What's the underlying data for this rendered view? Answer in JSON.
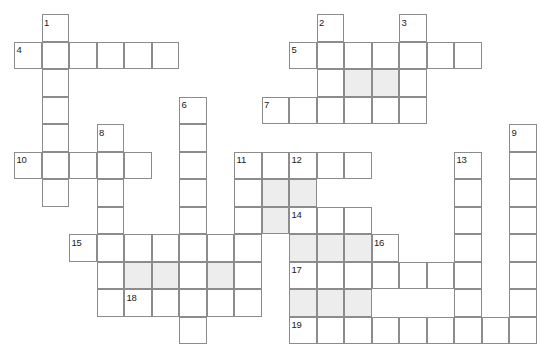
{
  "puzzle": {
    "kind": "crossword-grid",
    "width": 555,
    "height": 359,
    "origin_x": 14,
    "origin_y": 14,
    "cell": 27.5,
    "colors": {
      "background": "#ffffff",
      "cell_fill": "#ffffff",
      "shaded_fill": "#ededed",
      "border": "#8c8c8c",
      "number": "#1a1a1a"
    },
    "numbers": [
      {
        "label": "1",
        "col": 1,
        "row": 0
      },
      {
        "label": "2",
        "col": 11,
        "row": 0
      },
      {
        "label": "3",
        "col": 14,
        "row": 0
      },
      {
        "label": "4",
        "col": 0,
        "row": 1
      },
      {
        "label": "5",
        "col": 10,
        "row": 1
      },
      {
        "label": "6",
        "col": 6,
        "row": 3
      },
      {
        "label": "7",
        "col": 9,
        "row": 3
      },
      {
        "label": "8",
        "col": 3,
        "row": 4
      },
      {
        "label": "9",
        "col": 18,
        "row": 4
      },
      {
        "label": "10",
        "col": 0,
        "row": 5
      },
      {
        "label": "11",
        "col": 8,
        "row": 5
      },
      {
        "label": "12",
        "col": 10,
        "row": 5
      },
      {
        "label": "13",
        "col": 16,
        "row": 5
      },
      {
        "label": "14",
        "col": 10,
        "row": 7
      },
      {
        "label": "15",
        "col": 2,
        "row": 8
      },
      {
        "label": "16",
        "col": 13,
        "row": 8
      },
      {
        "label": "17",
        "col": 10,
        "row": 9
      },
      {
        "label": "18",
        "col": 4,
        "row": 10
      },
      {
        "label": "19",
        "col": 10,
        "row": 11
      }
    ],
    "entries": [
      {
        "name": "entry-1-down",
        "number": "1",
        "col": 1,
        "row": 0,
        "length": 6,
        "dir": "down"
      },
      {
        "name": "entry-2-down",
        "number": "2",
        "col": 11,
        "row": 0,
        "length": 4,
        "dir": "down"
      },
      {
        "name": "entry-3-down",
        "number": "3",
        "col": 14,
        "row": 0,
        "length": 4,
        "dir": "down"
      },
      {
        "name": "entry-4-across",
        "number": "4",
        "col": 0,
        "row": 1,
        "length": 6,
        "dir": "across"
      },
      {
        "name": "entry-5-across",
        "number": "5",
        "col": 10,
        "row": 1,
        "length": 7,
        "dir": "across"
      },
      {
        "name": "entry-6-down",
        "number": "6",
        "col": 6,
        "row": 3,
        "length": 8,
        "dir": "down"
      },
      {
        "name": "entry-7-across",
        "number": "7",
        "col": 9,
        "row": 3,
        "length": 6,
        "dir": "across"
      },
      {
        "name": "entry-8-down",
        "number": "8",
        "col": 3,
        "row": 4,
        "length": 6,
        "dir": "down"
      },
      {
        "name": "entry-9-down",
        "number": "9",
        "col": 18,
        "row": 4,
        "length": 8,
        "dir": "down"
      },
      {
        "name": "entry-10-across",
        "number": "10",
        "col": 0,
        "row": 5,
        "length": 5,
        "dir": "across"
      },
      {
        "name": "entry-11-down",
        "number": "11",
        "col": 8,
        "row": 5,
        "length": 6,
        "dir": "down"
      },
      {
        "name": "entry-11-across",
        "number": "11",
        "col": 8,
        "row": 5,
        "length": 2,
        "dir": "across"
      },
      {
        "name": "entry-12-down",
        "number": "12",
        "col": 10,
        "row": 5,
        "length": 7,
        "dir": "down"
      },
      {
        "name": "entry-12-across",
        "number": "12",
        "col": 10,
        "row": 5,
        "length": 3,
        "dir": "across"
      },
      {
        "name": "entry-13-down",
        "number": "13",
        "col": 16,
        "row": 5,
        "length": 7,
        "dir": "down"
      },
      {
        "name": "entry-14-across",
        "number": "14",
        "col": 10,
        "row": 7,
        "length": 3,
        "dir": "across"
      },
      {
        "name": "entry-15-across",
        "number": "15",
        "col": 2,
        "row": 8,
        "length": 7,
        "dir": "across"
      },
      {
        "name": "entry-16-across",
        "number": "16",
        "col": 13,
        "row": 8,
        "length": 1,
        "dir": "across"
      },
      {
        "name": "entry-17-across",
        "number": "17",
        "col": 10,
        "row": 9,
        "length": 6,
        "dir": "across"
      },
      {
        "name": "entry-18-across",
        "number": "18",
        "col": 4,
        "row": 10,
        "length": 5,
        "dir": "across"
      },
      {
        "name": "entry-19-across",
        "number": "19",
        "col": 10,
        "row": 11,
        "length": 9,
        "dir": "across"
      }
    ],
    "cells": [
      {
        "col": 1,
        "row": 0,
        "shaded": false
      },
      {
        "col": 11,
        "row": 0,
        "shaded": false
      },
      {
        "col": 14,
        "row": 0,
        "shaded": false
      },
      {
        "col": 0,
        "row": 1,
        "shaded": false
      },
      {
        "col": 1,
        "row": 1,
        "shaded": false
      },
      {
        "col": 2,
        "row": 1,
        "shaded": false
      },
      {
        "col": 3,
        "row": 1,
        "shaded": false
      },
      {
        "col": 4,
        "row": 1,
        "shaded": false
      },
      {
        "col": 5,
        "row": 1,
        "shaded": false
      },
      {
        "col": 10,
        "row": 1,
        "shaded": false
      },
      {
        "col": 11,
        "row": 1,
        "shaded": false
      },
      {
        "col": 12,
        "row": 1,
        "shaded": false
      },
      {
        "col": 13,
        "row": 1,
        "shaded": false
      },
      {
        "col": 14,
        "row": 1,
        "shaded": false
      },
      {
        "col": 15,
        "row": 1,
        "shaded": false
      },
      {
        "col": 16,
        "row": 1,
        "shaded": false
      },
      {
        "col": 1,
        "row": 2,
        "shaded": false
      },
      {
        "col": 11,
        "row": 2,
        "shaded": false
      },
      {
        "col": 12,
        "row": 2,
        "shaded": true
      },
      {
        "col": 13,
        "row": 2,
        "shaded": true
      },
      {
        "col": 14,
        "row": 2,
        "shaded": false
      },
      {
        "col": 1,
        "row": 3,
        "shaded": false
      },
      {
        "col": 6,
        "row": 3,
        "shaded": false
      },
      {
        "col": 9,
        "row": 3,
        "shaded": false
      },
      {
        "col": 10,
        "row": 3,
        "shaded": false
      },
      {
        "col": 11,
        "row": 3,
        "shaded": false
      },
      {
        "col": 12,
        "row": 3,
        "shaded": false
      },
      {
        "col": 13,
        "row": 3,
        "shaded": false
      },
      {
        "col": 14,
        "row": 3,
        "shaded": false
      },
      {
        "col": 1,
        "row": 4,
        "shaded": false
      },
      {
        "col": 3,
        "row": 4,
        "shaded": false
      },
      {
        "col": 6,
        "row": 4,
        "shaded": false
      },
      {
        "col": 18,
        "row": 4,
        "shaded": false
      },
      {
        "col": 0,
        "row": 5,
        "shaded": false
      },
      {
        "col": 1,
        "row": 5,
        "shaded": false
      },
      {
        "col": 2,
        "row": 5,
        "shaded": false
      },
      {
        "col": 3,
        "row": 5,
        "shaded": false
      },
      {
        "col": 4,
        "row": 5,
        "shaded": false
      },
      {
        "col": 6,
        "row": 5,
        "shaded": false
      },
      {
        "col": 8,
        "row": 5,
        "shaded": false
      },
      {
        "col": 9,
        "row": 5,
        "shaded": false
      },
      {
        "col": 10,
        "row": 5,
        "shaded": false
      },
      {
        "col": 11,
        "row": 5,
        "shaded": false
      },
      {
        "col": 12,
        "row": 5,
        "shaded": false
      },
      {
        "col": 16,
        "row": 5,
        "shaded": false
      },
      {
        "col": 18,
        "row": 5,
        "shaded": false
      },
      {
        "col": 1,
        "row": 6,
        "shaded": false
      },
      {
        "col": 3,
        "row": 6,
        "shaded": false
      },
      {
        "col": 6,
        "row": 6,
        "shaded": false
      },
      {
        "col": 8,
        "row": 6,
        "shaded": false
      },
      {
        "col": 9,
        "row": 6,
        "shaded": true
      },
      {
        "col": 10,
        "row": 6,
        "shaded": true
      },
      {
        "col": 16,
        "row": 6,
        "shaded": false
      },
      {
        "col": 18,
        "row": 6,
        "shaded": false
      },
      {
        "col": 3,
        "row": 7,
        "shaded": false
      },
      {
        "col": 6,
        "row": 7,
        "shaded": false
      },
      {
        "col": 8,
        "row": 7,
        "shaded": false
      },
      {
        "col": 9,
        "row": 7,
        "shaded": true
      },
      {
        "col": 10,
        "row": 7,
        "shaded": false
      },
      {
        "col": 11,
        "row": 7,
        "shaded": false
      },
      {
        "col": 12,
        "row": 7,
        "shaded": false
      },
      {
        "col": 16,
        "row": 7,
        "shaded": false
      },
      {
        "col": 18,
        "row": 7,
        "shaded": false
      },
      {
        "col": 2,
        "row": 8,
        "shaded": false
      },
      {
        "col": 3,
        "row": 8,
        "shaded": false
      },
      {
        "col": 4,
        "row": 8,
        "shaded": false
      },
      {
        "col": 5,
        "row": 8,
        "shaded": false
      },
      {
        "col": 6,
        "row": 8,
        "shaded": false
      },
      {
        "col": 7,
        "row": 8,
        "shaded": false
      },
      {
        "col": 8,
        "row": 8,
        "shaded": false
      },
      {
        "col": 10,
        "row": 8,
        "shaded": true
      },
      {
        "col": 11,
        "row": 8,
        "shaded": true
      },
      {
        "col": 12,
        "row": 8,
        "shaded": true
      },
      {
        "col": 13,
        "row": 8,
        "shaded": false
      },
      {
        "col": 16,
        "row": 8,
        "shaded": false
      },
      {
        "col": 18,
        "row": 8,
        "shaded": false
      },
      {
        "col": 3,
        "row": 9,
        "shaded": false
      },
      {
        "col": 4,
        "row": 9,
        "shaded": true
      },
      {
        "col": 5,
        "row": 9,
        "shaded": true
      },
      {
        "col": 6,
        "row": 9,
        "shaded": false
      },
      {
        "col": 7,
        "row": 9,
        "shaded": true
      },
      {
        "col": 8,
        "row": 9,
        "shaded": false
      },
      {
        "col": 10,
        "row": 9,
        "shaded": false
      },
      {
        "col": 11,
        "row": 9,
        "shaded": false
      },
      {
        "col": 12,
        "row": 9,
        "shaded": false
      },
      {
        "col": 13,
        "row": 9,
        "shaded": false
      },
      {
        "col": 14,
        "row": 9,
        "shaded": false
      },
      {
        "col": 15,
        "row": 9,
        "shaded": false
      },
      {
        "col": 16,
        "row": 9,
        "shaded": false
      },
      {
        "col": 18,
        "row": 9,
        "shaded": false
      },
      {
        "col": 3,
        "row": 10,
        "shaded": false
      },
      {
        "col": 4,
        "row": 10,
        "shaded": false
      },
      {
        "col": 5,
        "row": 10,
        "shaded": false
      },
      {
        "col": 6,
        "row": 10,
        "shaded": false
      },
      {
        "col": 7,
        "row": 10,
        "shaded": false
      },
      {
        "col": 8,
        "row": 10,
        "shaded": false
      },
      {
        "col": 10,
        "row": 10,
        "shaded": true
      },
      {
        "col": 11,
        "row": 10,
        "shaded": true
      },
      {
        "col": 12,
        "row": 10,
        "shaded": true
      },
      {
        "col": 16,
        "row": 10,
        "shaded": false
      },
      {
        "col": 18,
        "row": 10,
        "shaded": false
      },
      {
        "col": 6,
        "row": 11,
        "shaded": false
      },
      {
        "col": 10,
        "row": 11,
        "shaded": false
      },
      {
        "col": 11,
        "row": 11,
        "shaded": false
      },
      {
        "col": 12,
        "row": 11,
        "shaded": false
      },
      {
        "col": 13,
        "row": 11,
        "shaded": false
      },
      {
        "col": 14,
        "row": 11,
        "shaded": false
      },
      {
        "col": 15,
        "row": 11,
        "shaded": false
      },
      {
        "col": 16,
        "row": 11,
        "shaded": false
      },
      {
        "col": 17,
        "row": 11,
        "shaded": false
      },
      {
        "col": 18,
        "row": 11,
        "shaded": false
      }
    ]
  }
}
